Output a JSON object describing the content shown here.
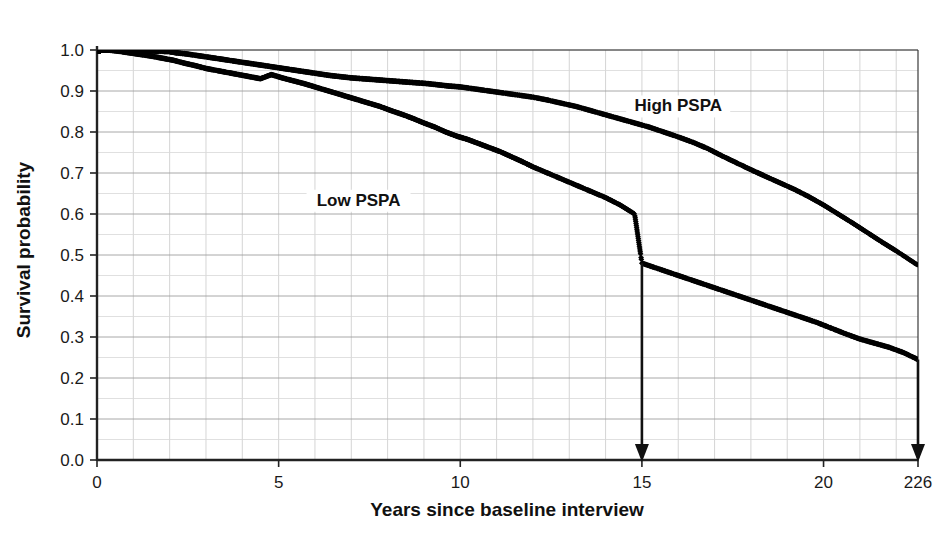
{
  "chart_data": {
    "type": "line",
    "title": "",
    "subtitle": "",
    "xlabel": "Years since baseline interview",
    "ylabel": "Survival probability",
    "xlim": [
      0,
      22.6
    ],
    "ylim": [
      0.0,
      1.0
    ],
    "grid": true,
    "grid_minor_x_step": 1,
    "grid_major_y_step": 0.1,
    "legend_position": "inline-annotation",
    "x_tick_labels": [
      "0",
      "5",
      "10",
      "15",
      "20",
      "226"
    ],
    "x_tick_values": [
      0,
      5,
      10,
      15,
      20,
      22.6
    ],
    "y_tick_labels": [
      "0.0",
      "0.1",
      "0.2",
      "0.3",
      "0.4",
      "0.5",
      "0.6",
      "0.7",
      "0.8",
      "0.9",
      "1.0"
    ],
    "y_tick_values": [
      0.0,
      0.1,
      0.2,
      0.3,
      0.4,
      0.5,
      0.6,
      0.7,
      0.8,
      0.9,
      1.0
    ],
    "marker_style": "filled-diamond",
    "marker_color": "#000000",
    "series": [
      {
        "name": "High PSPA",
        "label": "High PSPA",
        "label_x": 16.0,
        "label_y": 0.855,
        "color": "#000000",
        "x": [
          0,
          0.4,
          0.8,
          1.2,
          1.6,
          2.0,
          2.2,
          2.5,
          2.8,
          3.1,
          3.4,
          3.7,
          4.0,
          4.3,
          4.6,
          4.9,
          5.2,
          5.5,
          5.8,
          6.1,
          6.4,
          6.7,
          7.0,
          7.3,
          7.6,
          7.9,
          8.2,
          8.5,
          8.8,
          9.1,
          9.4,
          9.7,
          10.0,
          10.4,
          10.8,
          11.2,
          11.6,
          12.0,
          12.4,
          12.8,
          13.2,
          13.6,
          14.0,
          14.4,
          14.8,
          15.2,
          15.6,
          16.0,
          16.4,
          16.8,
          17.2,
          17.6,
          18.0,
          18.4,
          18.8,
          19.2,
          19.6,
          20.0,
          20.4,
          20.8,
          21.2,
          21.6,
          22.0,
          22.6
        ],
        "y": [
          1.0,
          1.0,
          1.0,
          0.998,
          0.997,
          0.996,
          0.993,
          0.99,
          0.986,
          0.982,
          0.978,
          0.974,
          0.97,
          0.966,
          0.962,
          0.958,
          0.954,
          0.95,
          0.946,
          0.942,
          0.938,
          0.935,
          0.932,
          0.93,
          0.928,
          0.926,
          0.924,
          0.922,
          0.92,
          0.918,
          0.915,
          0.912,
          0.91,
          0.905,
          0.9,
          0.895,
          0.89,
          0.885,
          0.878,
          0.87,
          0.862,
          0.852,
          0.842,
          0.832,
          0.822,
          0.812,
          0.8,
          0.788,
          0.775,
          0.76,
          0.742,
          0.725,
          0.708,
          0.692,
          0.676,
          0.66,
          0.642,
          0.622,
          0.6,
          0.578,
          0.555,
          0.532,
          0.51,
          0.475
        ]
      },
      {
        "name": "Low PSPA",
        "label": "Low PSPA",
        "label_x": 7.2,
        "label_y": 0.625,
        "color": "#000000",
        "x": [
          0,
          0.3,
          0.6,
          0.9,
          1.2,
          1.5,
          1.8,
          2.1,
          2.4,
          2.7,
          3.0,
          3.3,
          3.6,
          3.9,
          4.2,
          4.5,
          4.8,
          5.1,
          5.4,
          5.7,
          6.0,
          6.3,
          6.6,
          6.9,
          7.2,
          7.5,
          7.8,
          8.1,
          8.4,
          8.7,
          9.0,
          9.3,
          9.6,
          9.9,
          10.2,
          10.5,
          10.8,
          11.1,
          11.4,
          11.7,
          12.0,
          12.4,
          12.8,
          13.2,
          13.6,
          14.0,
          14.4,
          14.8,
          15.0,
          15.4,
          15.8,
          16.2,
          16.6,
          17.0,
          17.4,
          17.8,
          18.2,
          18.6,
          19.0,
          19.4,
          19.8,
          20.2,
          20.6,
          21.0,
          21.4,
          21.8,
          22.2,
          22.6
        ],
        "y": [
          1.0,
          1.0,
          0.997,
          0.993,
          0.989,
          0.985,
          0.98,
          0.975,
          0.968,
          0.962,
          0.955,
          0.95,
          0.945,
          0.94,
          0.935,
          0.93,
          0.94,
          0.932,
          0.925,
          0.918,
          0.91,
          0.902,
          0.894,
          0.886,
          0.878,
          0.87,
          0.862,
          0.852,
          0.843,
          0.833,
          0.822,
          0.812,
          0.8,
          0.79,
          0.782,
          0.772,
          0.762,
          0.752,
          0.74,
          0.728,
          0.715,
          0.7,
          0.685,
          0.67,
          0.655,
          0.64,
          0.622,
          0.6,
          0.48,
          0.468,
          0.456,
          0.444,
          0.432,
          0.42,
          0.408,
          0.396,
          0.384,
          0.372,
          0.36,
          0.348,
          0.336,
          0.322,
          0.308,
          0.295,
          0.285,
          0.275,
          0.262,
          0.245
        ]
      }
    ],
    "annotations": [
      {
        "name": "arrow-at-15",
        "type": "down-arrow",
        "x": 15.0,
        "y_from": 0.48,
        "y_to": 0.0
      },
      {
        "name": "arrow-at-226",
        "type": "down-arrow",
        "x": 22.6,
        "y_from": 0.245,
        "y_to": 0.0
      }
    ]
  },
  "colors": {
    "marker": "#000000",
    "axis": "#2b2b2b",
    "grid_major": "#9a9a9a",
    "grid_minor": "#c9c9c9",
    "background": "#ffffff",
    "text": "#111111"
  }
}
